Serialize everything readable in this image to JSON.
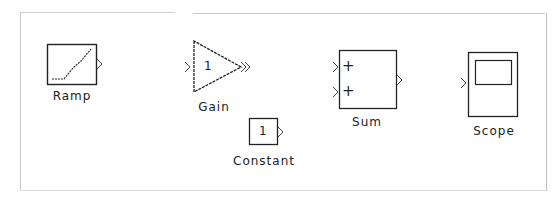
{
  "canvas": {
    "background": "#ffffff",
    "border_color": "#c8c8c8"
  },
  "blocks": {
    "ramp": {
      "label": "Ramp",
      "type": "source",
      "ports": {
        "inputs": 0,
        "outputs": 1
      }
    },
    "gain": {
      "label": "Gain",
      "value": "1",
      "type": "math",
      "ports": {
        "inputs": 1,
        "outputs": 1
      }
    },
    "constant": {
      "label": "Constant",
      "value": "1",
      "type": "source",
      "ports": {
        "inputs": 0,
        "outputs": 1
      }
    },
    "sum": {
      "label": "Sum",
      "signs": [
        "+",
        "+"
      ],
      "type": "math",
      "ports": {
        "inputs": 2,
        "outputs": 1
      }
    },
    "scope": {
      "label": "Scope",
      "type": "sink",
      "ports": {
        "inputs": 1,
        "outputs": 0
      }
    }
  },
  "colors": {
    "stroke": "#222222"
  }
}
